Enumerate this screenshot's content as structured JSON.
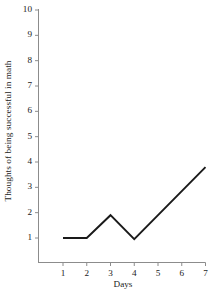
{
  "chart_data": {
    "type": "line",
    "title": "",
    "xlabel": "Days",
    "ylabel": "Thoughts of being successful in math",
    "x": [
      1,
      2,
      3,
      4,
      7
    ],
    "values": [
      1,
      1,
      1.9,
      0.95,
      3.8
    ],
    "series": [
      {
        "name": "Thoughts of being successful in math",
        "x": [
          1,
          2,
          3,
          4,
          7
        ],
        "values": [
          1,
          1,
          1.9,
          0.95,
          3.8
        ]
      }
    ],
    "xlim": [
      0.4,
      7
    ],
    "ylim": [
      0.35,
      10
    ],
    "xticks": [
      1,
      2,
      3,
      4,
      5,
      6,
      7
    ],
    "yticks": [
      1,
      2,
      3,
      4,
      5,
      6,
      7,
      8,
      9,
      10
    ],
    "xtick_labels": [
      "1",
      "2",
      "3",
      "4",
      "5",
      "6",
      "7"
    ],
    "ytick_labels": [
      "1",
      "2",
      "3",
      "4",
      "5",
      "6",
      "7",
      "8",
      "9",
      "10"
    ],
    "grid": false,
    "legend": false,
    "legend_position": "none",
    "line_color": "#1a1a1a",
    "axis_color": "#8c8c8c",
    "background_color": "#ffffff"
  }
}
